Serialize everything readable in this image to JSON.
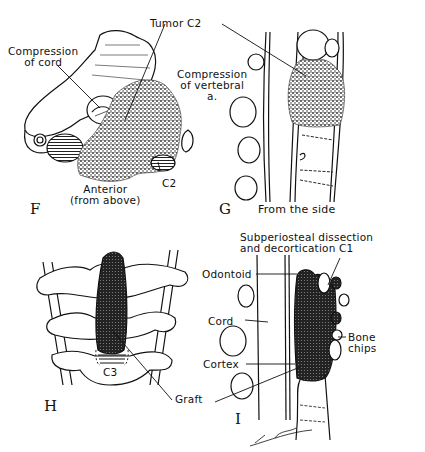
{
  "panels": {
    "F": {
      "letter": "F",
      "labels": {
        "compression_cord": [
          "Compression",
          "of cord"
        ],
        "tumor": "Tumor C2",
        "compression_vertebral": [
          "Compression",
          "of vertebral",
          "a."
        ],
        "c2": "C2",
        "view": [
          "Anterior",
          "(from above)"
        ]
      }
    },
    "G": {
      "letter": "G",
      "labels": {
        "view": "From the side"
      }
    },
    "H": {
      "letter": "H",
      "labels": {
        "c3": "C3",
        "graft": "Graft"
      }
    },
    "I": {
      "letter": "I",
      "labels": {
        "subperiosteal": [
          "Subperiosteal dissection",
          "and decortication C1"
        ],
        "odontoid": "Odontoid",
        "cord": "Cord",
        "cortex": "Cortex",
        "bone_chips": [
          "Bone",
          "chips"
        ]
      }
    }
  },
  "colors": {
    "ink": "#111111",
    "background": "#ffffff"
  }
}
